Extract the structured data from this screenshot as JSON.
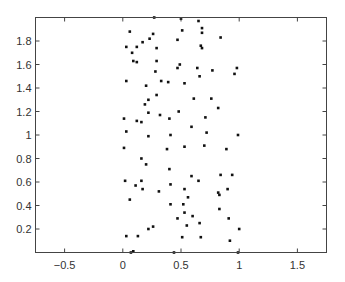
{
  "chart_data": {
    "type": "scatter",
    "title": "",
    "xlabel": "",
    "ylabel": "",
    "xlim": [
      -0.75,
      1.75
    ],
    "ylim": [
      0,
      2
    ],
    "grid": false,
    "legend": null,
    "xticks": [
      -0.5,
      0,
      0.5,
      1,
      1.5
    ],
    "xtick_labels": [
      "-0.5",
      "0",
      "0.5",
      "1",
      "1.5"
    ],
    "yticks": [
      0.2,
      0.4,
      0.6,
      0.8,
      1,
      1.2,
      1.4,
      1.6,
      1.8
    ],
    "ytick_labels": [
      "0.2",
      "0.4",
      "0.6",
      "0.8",
      "1",
      "1.2",
      "1.4",
      "1.6",
      "1.8"
    ],
    "series": [
      {
        "name": "points",
        "marker": "dot",
        "color": "#111111",
        "points": [
          [
            0.27,
            2.0
          ],
          [
            0.5,
            1.99
          ],
          [
            0.65,
            1.97
          ],
          [
            0.06,
            1.88
          ],
          [
            0.26,
            1.86
          ],
          [
            0.51,
            1.89
          ],
          [
            0.68,
            1.91
          ],
          [
            0.68,
            1.87
          ],
          [
            0.17,
            1.79
          ],
          [
            0.23,
            1.82
          ],
          [
            0.12,
            1.75
          ],
          [
            0.29,
            1.74
          ],
          [
            0.03,
            1.75
          ],
          [
            0.08,
            1.7
          ],
          [
            0.47,
            1.81
          ],
          [
            0.84,
            1.83
          ],
          [
            0.67,
            1.76
          ],
          [
            0.68,
            1.74
          ],
          [
            0.09,
            1.63
          ],
          [
            0.12,
            1.62
          ],
          [
            0.29,
            1.63
          ],
          [
            0.47,
            1.57
          ],
          [
            0.49,
            1.6
          ],
          [
            0.28,
            1.54
          ],
          [
            0.64,
            1.57
          ],
          [
            0.77,
            1.55
          ],
          [
            0.66,
            1.5
          ],
          [
            0.98,
            1.57
          ],
          [
            0.96,
            1.52
          ],
          [
            0.03,
            1.46
          ],
          [
            0.2,
            1.42
          ],
          [
            0.33,
            1.46
          ],
          [
            0.39,
            1.45
          ],
          [
            0.53,
            1.44
          ],
          [
            0.61,
            1.31
          ],
          [
            0.76,
            1.31
          ],
          [
            0.29,
            1.34
          ],
          [
            0.22,
            1.3
          ],
          [
            0.19,
            1.26
          ],
          [
            0.82,
            1.23
          ],
          [
            0.22,
            1.19
          ],
          [
            0.32,
            1.17
          ],
          [
            0.48,
            1.2
          ],
          [
            0.71,
            1.15
          ],
          [
            0.01,
            1.14
          ],
          [
            0.12,
            1.12
          ],
          [
            0.16,
            1.11
          ],
          [
            0.4,
            1.14
          ],
          [
            0.59,
            1.07
          ],
          [
            0.03,
            1.03
          ],
          [
            0.41,
            1.0
          ],
          [
            0.72,
            1.02
          ],
          [
            0.99,
            1.0
          ],
          [
            0.22,
            0.99
          ],
          [
            0.53,
            0.9
          ],
          [
            0.7,
            0.91
          ],
          [
            0.01,
            0.89
          ],
          [
            0.38,
            0.88
          ],
          [
            0.89,
            0.88
          ],
          [
            0.16,
            0.8
          ],
          [
            0.2,
            0.75
          ],
          [
            0.4,
            0.71
          ],
          [
            0.59,
            0.65
          ],
          [
            0.65,
            0.61
          ],
          [
            0.84,
            0.66
          ],
          [
            0.94,
            0.66
          ],
          [
            0.02,
            0.61
          ],
          [
            0.16,
            0.61
          ],
          [
            0.11,
            0.57
          ],
          [
            0.17,
            0.54
          ],
          [
            0.41,
            0.58
          ],
          [
            0.31,
            0.52
          ],
          [
            0.53,
            0.54
          ],
          [
            0.82,
            0.51
          ],
          [
            0.83,
            0.49
          ],
          [
            0.9,
            0.54
          ],
          [
            0.06,
            0.45
          ],
          [
            0.41,
            0.41
          ],
          [
            0.52,
            0.41
          ],
          [
            0.56,
            0.47
          ],
          [
            0.53,
            0.34
          ],
          [
            0.6,
            0.31
          ],
          [
            0.83,
            0.37
          ],
          [
            0.91,
            0.29
          ],
          [
            0.47,
            0.29
          ],
          [
            0.66,
            0.25
          ],
          [
            0.55,
            0.23
          ],
          [
            0.22,
            0.2
          ],
          [
            0.26,
            0.22
          ],
          [
            1.0,
            0.2
          ],
          [
            0.03,
            0.14
          ],
          [
            0.13,
            0.14
          ],
          [
            0.51,
            0.13
          ],
          [
            0.67,
            0.13
          ],
          [
            0.92,
            0.1
          ],
          [
            0.07,
            0.0
          ],
          [
            0.09,
            0.01
          ],
          [
            0.44,
            0.0
          ],
          [
            0.99,
            0.0
          ]
        ]
      }
    ]
  }
}
